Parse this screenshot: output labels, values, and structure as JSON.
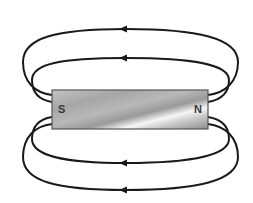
{
  "diagram": {
    "magnet": {
      "south_label": "S",
      "north_label": "N",
      "x": 52,
      "y": 90,
      "width": 156,
      "height": 39
    },
    "field_lines": [
      {
        "name": "top-outer",
        "arrow_direction": "left"
      },
      {
        "name": "top-inner",
        "arrow_direction": "left"
      },
      {
        "name": "bottom-inner",
        "arrow_direction": "left"
      },
      {
        "name": "bottom-outer",
        "arrow_direction": "left"
      }
    ],
    "colors": {
      "line": "#1a1a1a",
      "magnet_border": "#555555",
      "magnet_light": "#f4f4f4",
      "magnet_dark": "#8f8f8f"
    }
  }
}
